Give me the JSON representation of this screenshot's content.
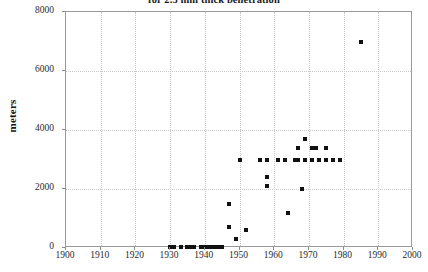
{
  "chart_data": {
    "type": "scatter",
    "title": "for 2.5 mm thick penetration",
    "xlabel": "",
    "ylabel": "meters",
    "xlim": [
      1900,
      2000
    ],
    "ylim": [
      0,
      8000
    ],
    "xticks": [
      1900,
      1910,
      1920,
      1930,
      1940,
      1950,
      1960,
      1970,
      1980,
      1990,
      2000
    ],
    "yticks": [
      0,
      2000,
      4000,
      6000,
      8000
    ],
    "grid": true,
    "legend": null,
    "marker": "filled-square",
    "marker_color": "#111111",
    "points": [
      {
        "x": 1930,
        "y": 30
      },
      {
        "x": 1931,
        "y": 30
      },
      {
        "x": 1933,
        "y": 30
      },
      {
        "x": 1935,
        "y": 30
      },
      {
        "x": 1936,
        "y": 30
      },
      {
        "x": 1937,
        "y": 30
      },
      {
        "x": 1939,
        "y": 30
      },
      {
        "x": 1940,
        "y": 30
      },
      {
        "x": 1941,
        "y": 30
      },
      {
        "x": 1942,
        "y": 30
      },
      {
        "x": 1943,
        "y": 30
      },
      {
        "x": 1944,
        "y": 30
      },
      {
        "x": 1945,
        "y": 30
      },
      {
        "x": 1947,
        "y": 1500
      },
      {
        "x": 1947,
        "y": 700
      },
      {
        "x": 1949,
        "y": 300
      },
      {
        "x": 1950,
        "y": 3000
      },
      {
        "x": 1952,
        "y": 600
      },
      {
        "x": 1956,
        "y": 3000
      },
      {
        "x": 1958,
        "y": 3000
      },
      {
        "x": 1958,
        "y": 2400
      },
      {
        "x": 1958,
        "y": 2100
      },
      {
        "x": 1961,
        "y": 3000
      },
      {
        "x": 1963,
        "y": 3000
      },
      {
        "x": 1964,
        "y": 1200
      },
      {
        "x": 1966,
        "y": 3000
      },
      {
        "x": 1967,
        "y": 3000
      },
      {
        "x": 1967,
        "y": 3400
      },
      {
        "x": 1968,
        "y": 2000
      },
      {
        "x": 1969,
        "y": 3000
      },
      {
        "x": 1969,
        "y": 3700
      },
      {
        "x": 1971,
        "y": 3000
      },
      {
        "x": 1971,
        "y": 3400
      },
      {
        "x": 1972,
        "y": 3400
      },
      {
        "x": 1973,
        "y": 3000
      },
      {
        "x": 1975,
        "y": 3000
      },
      {
        "x": 1975,
        "y": 3400
      },
      {
        "x": 1977,
        "y": 3000
      },
      {
        "x": 1979,
        "y": 3000
      },
      {
        "x": 1985,
        "y": 7000
      }
    ]
  }
}
